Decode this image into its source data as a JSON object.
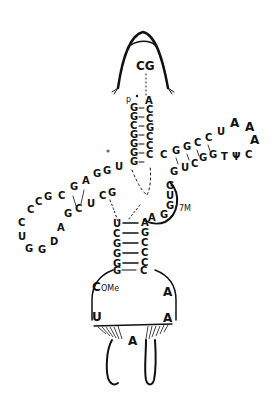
{
  "diagram": {
    "type": "tRNA cloverleaf (hand-drawn, L-shaped)",
    "top_cap_label": "CG",
    "acceptor_stem": {
      "five_prime_label": "p",
      "left": [
        "G",
        "G",
        "C",
        "G",
        "G",
        "G",
        "G"
      ],
      "right": [
        "A",
        "C",
        "C",
        "G",
        "C",
        "C",
        "C"
      ]
    },
    "junction": {
      "star_label": "*",
      "nts": [
        "U",
        "G",
        "G"
      ]
    },
    "d_arm": {
      "stem_top": [
        "A",
        "G",
        "C"
      ],
      "stem_bottom": [
        "G",
        "C",
        "U",
        "C",
        "G"
      ],
      "loop": [
        "G",
        "A",
        "C",
        "C",
        "C",
        "U",
        "G",
        "G",
        "D",
        "A"
      ]
    },
    "t_arm": {
      "stem_top": [
        "C",
        "G",
        "G",
        "C",
        "C"
      ],
      "stem_bottom": [
        "G",
        "U",
        "C",
        "G",
        "G"
      ],
      "loop": [
        "U",
        "A",
        "A",
        "A",
        "C",
        "Ψ",
        "T"
      ]
    },
    "variable_loop": {
      "nts": [
        "G",
        "U",
        "G",
        "G",
        "A"
      ],
      "modification_label": "7M"
    },
    "anticodon_stem": {
      "left": [
        "U",
        "C",
        "G",
        "G",
        "G"
      ],
      "right": [
        "A",
        "G",
        "C",
        "C",
        "C"
      ]
    },
    "anticodon_loop": {
      "top": [
        "G",
        "C"
      ],
      "left": [
        "C",
        "U"
      ],
      "left_mod_label": "OMe",
      "right": [
        "A",
        "A"
      ],
      "bottom": "A"
    }
  }
}
